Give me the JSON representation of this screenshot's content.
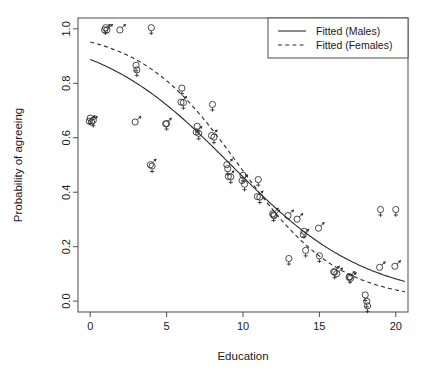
{
  "chart_data": {
    "type": "scatter",
    "title": "",
    "xlabel": "Education",
    "ylabel": "Probability of agreeing",
    "xlim": [
      -0.8,
      20.8
    ],
    "ylim": [
      -0.04,
      1.04
    ],
    "xticks": [
      0,
      5,
      10,
      15,
      20
    ],
    "xtick_labels": [
      "0",
      "5",
      "10",
      "15",
      "20"
    ],
    "yticks": [
      0.0,
      0.2,
      0.4,
      0.6,
      0.8,
      1.0
    ],
    "ytick_labels": [
      "0.0",
      "0.2",
      "0.4",
      "0.6",
      "0.8",
      "1.0"
    ],
    "grid": false,
    "legend_position": "top-right",
    "legend": [
      {
        "label": "Fitted (Males)",
        "style": "solid",
        "marker": "none"
      },
      {
        "label": "Fitted (Females)",
        "style": "dashed",
        "marker": "none"
      }
    ],
    "series": [
      {
        "name": "Males (observed)",
        "marker": "mars",
        "points": [
          [
            0.0,
            0.665
          ],
          [
            0.15,
            0.662
          ],
          [
            1.0,
            1.0
          ],
          [
            1.15,
            1.0
          ],
          [
            2.0,
            1.0
          ],
          [
            3.0,
            0.662
          ],
          [
            4.0,
            0.505
          ],
          [
            5.0,
            0.655
          ],
          [
            6.0,
            0.735
          ],
          [
            7.0,
            0.625
          ],
          [
            8.0,
            0.612
          ],
          [
            9.0,
            0.505
          ],
          [
            9.1,
            0.462
          ],
          [
            10.0,
            0.447
          ],
          [
            11.0,
            0.388
          ],
          [
            12.0,
            0.325
          ],
          [
            12.1,
            0.318
          ],
          [
            13.0,
            0.318
          ],
          [
            13.6,
            0.305
          ],
          [
            14.0,
            0.248
          ],
          [
            15.0,
            0.272
          ],
          [
            16.0,
            0.112
          ],
          [
            16.2,
            0.105
          ],
          [
            17.0,
            0.092
          ],
          [
            17.1,
            0.088
          ],
          [
            19.0,
            0.128
          ],
          [
            20.0,
            0.132
          ]
        ]
      },
      {
        "name": "Females (observed)",
        "marker": "venus",
        "points": [
          [
            0.0,
            0.668
          ],
          [
            0.2,
            0.66
          ],
          [
            1.0,
            1.0
          ],
          [
            3.0,
            0.862
          ],
          [
            3.05,
            0.845
          ],
          [
            4.0,
            1.0
          ],
          [
            4.05,
            0.492
          ],
          [
            5.0,
            0.648
          ],
          [
            6.0,
            0.778
          ],
          [
            6.1,
            0.725
          ],
          [
            7.0,
            0.638
          ],
          [
            7.1,
            0.612
          ],
          [
            8.0,
            0.718
          ],
          [
            8.1,
            0.598
          ],
          [
            9.0,
            0.482
          ],
          [
            9.2,
            0.452
          ],
          [
            10.0,
            0.458
          ],
          [
            10.1,
            0.425
          ],
          [
            11.0,
            0.442
          ],
          [
            11.1,
            0.378
          ],
          [
            12.0,
            0.312
          ],
          [
            13.0,
            0.152
          ],
          [
            14.0,
            0.252
          ],
          [
            14.1,
            0.182
          ],
          [
            15.0,
            0.162
          ],
          [
            16.0,
            0.102
          ],
          [
            17.0,
            0.085
          ],
          [
            18.0,
            0.018
          ],
          [
            18.1,
            -0.005
          ],
          [
            18.15,
            -0.022
          ],
          [
            19.0,
            0.332
          ],
          [
            20.0,
            0.332
          ]
        ]
      }
    ],
    "fitted_curves": [
      {
        "name": "Fitted (Males)",
        "style": "solid",
        "logit_intercept": 2.07,
        "logit_slope": -0.2245,
        "x_range": [
          0,
          20.6
        ]
      },
      {
        "name": "Fitted (Females)",
        "style": "dashed",
        "logit_intercept": 2.98,
        "logit_slope": -0.3065,
        "x_range": [
          0,
          20.6
        ]
      }
    ],
    "colors": {
      "line": "#2b2b2b",
      "axis": "#4d4d4d",
      "text": "#1a1a1a",
      "background": "#ffffff"
    }
  }
}
